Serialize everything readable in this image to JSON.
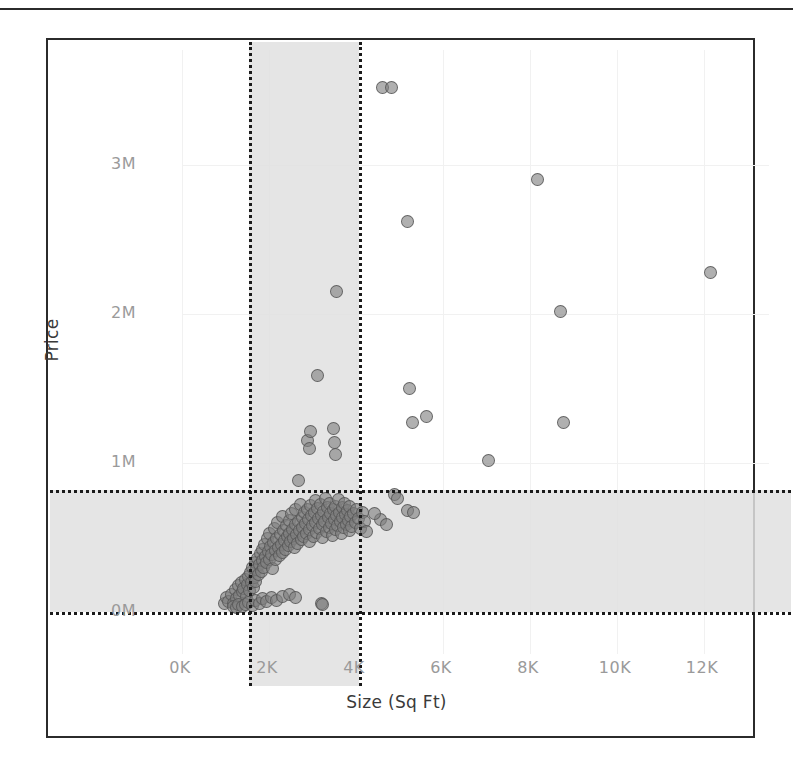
{
  "chart_data": {
    "type": "scatter",
    "title": "",
    "xlabel": "Size (Sq Ft)",
    "ylabel": "Price",
    "xlim": [
      0,
      13150
    ],
    "ylim": [
      -260000,
      4060000
    ],
    "xticks": [
      "0K",
      "2K",
      "4K",
      "6K",
      "8K",
      "10K",
      "12K"
    ],
    "xtick_values": [
      0,
      2000,
      4000,
      6000,
      8000,
      10000,
      12000
    ],
    "yticks": [
      "0M",
      "1M",
      "2M",
      "3M"
    ],
    "ytick_values": [
      0,
      1000000,
      2000000,
      3000000
    ],
    "grid": true,
    "legend": false,
    "marker_color": "#808080",
    "marker_edge_color": "#555555",
    "selection_band_color": "#e0e0e0",
    "selection_line_color": "#1a1a1a",
    "selections": [
      {
        "axis": "x",
        "label": "size-brush",
        "from": 1540,
        "to": 4070
      },
      {
        "axis": "y",
        "label": "price-brush",
        "from": 0,
        "to": 820000
      }
    ],
    "points": [
      [
        980,
        60000
      ],
      [
        1020,
        95000
      ],
      [
        1080,
        70000
      ],
      [
        1140,
        120000
      ],
      [
        1190,
        55000
      ],
      [
        1230,
        150000
      ],
      [
        1260,
        90000
      ],
      [
        1300,
        175000
      ],
      [
        1330,
        110000
      ],
      [
        1360,
        200000
      ],
      [
        1390,
        135000
      ],
      [
        1420,
        160000
      ],
      [
        1450,
        215000
      ],
      [
        1480,
        105000
      ],
      [
        1510,
        185000
      ],
      [
        1540,
        240000
      ],
      [
        1560,
        145000
      ],
      [
        1580,
        265000
      ],
      [
        1600,
        195000
      ],
      [
        1620,
        300000
      ],
      [
        1650,
        165000
      ],
      [
        1660,
        230000
      ],
      [
        1680,
        330000
      ],
      [
        1700,
        205000
      ],
      [
        1720,
        285000
      ],
      [
        1740,
        360000
      ],
      [
        1760,
        250000
      ],
      [
        1780,
        320000
      ],
      [
        1800,
        390000
      ],
      [
        1820,
        275000
      ],
      [
        1840,
        420000
      ],
      [
        1860,
        345000
      ],
      [
        1880,
        300000
      ],
      [
        1900,
        455000
      ],
      [
        1920,
        375000
      ],
      [
        1940,
        330000
      ],
      [
        1960,
        490000
      ],
      [
        1980,
        405000
      ],
      [
        2000,
        355000
      ],
      [
        2020,
        530000
      ],
      [
        2040,
        440000
      ],
      [
        2060,
        385000
      ],
      [
        2080,
        290000
      ],
      [
        2100,
        465000
      ],
      [
        2120,
        560000
      ],
      [
        2140,
        410000
      ],
      [
        2160,
        350000
      ],
      [
        2180,
        495000
      ],
      [
        2200,
        600000
      ],
      [
        2220,
        435000
      ],
      [
        2240,
        380000
      ],
      [
        2260,
        520000
      ],
      [
        2280,
        455000
      ],
      [
        2300,
        640000
      ],
      [
        2320,
        400000
      ],
      [
        2340,
        545000
      ],
      [
        2360,
        480000
      ],
      [
        2380,
        420000
      ],
      [
        2400,
        580000
      ],
      [
        2420,
        505000
      ],
      [
        2440,
        445000
      ],
      [
        2460,
        615000
      ],
      [
        2480,
        530000
      ],
      [
        2500,
        470000
      ],
      [
        2520,
        660000
      ],
      [
        2540,
        555000
      ],
      [
        2560,
        495000
      ],
      [
        2580,
        430000
      ],
      [
        2600,
        585000
      ],
      [
        2620,
        690000
      ],
      [
        2640,
        520000
      ],
      [
        2660,
        460000
      ],
      [
        2680,
        610000
      ],
      [
        2700,
        545000
      ],
      [
        2720,
        720000
      ],
      [
        2740,
        485000
      ],
      [
        2760,
        635000
      ],
      [
        2780,
        570000
      ],
      [
        2800,
        505000
      ],
      [
        2820,
        665000
      ],
      [
        2840,
        595000
      ],
      [
        2860,
        530000
      ],
      [
        2880,
        690000
      ],
      [
        2900,
        620000
      ],
      [
        2920,
        555000
      ],
      [
        2940,
        470000
      ],
      [
        2960,
        715000
      ],
      [
        2980,
        645000
      ],
      [
        3000,
        580000
      ],
      [
        3020,
        510000
      ],
      [
        3040,
        670000
      ],
      [
        3060,
        600000
      ],
      [
        3080,
        745000
      ],
      [
        3100,
        535000
      ],
      [
        3120,
        695000
      ],
      [
        3140,
        625000
      ],
      [
        3160,
        560000
      ],
      [
        3180,
        720000
      ],
      [
        3200,
        650000
      ],
      [
        3220,
        585000
      ],
      [
        3240,
        500000
      ],
      [
        3260,
        675000
      ],
      [
        3280,
        610000
      ],
      [
        3300,
        760000
      ],
      [
        3320,
        540000
      ],
      [
        3340,
        700000
      ],
      [
        3360,
        635000
      ],
      [
        3380,
        570000
      ],
      [
        3400,
        730000
      ],
      [
        3420,
        660000
      ],
      [
        3440,
        595000
      ],
      [
        3460,
        515000
      ],
      [
        3480,
        685000
      ],
      [
        3500,
        620000
      ],
      [
        3520,
        555000
      ],
      [
        3540,
        710000
      ],
      [
        3560,
        645000
      ],
      [
        3580,
        580000
      ],
      [
        3600,
        755000
      ],
      [
        3620,
        670000
      ],
      [
        3640,
        605000
      ],
      [
        3660,
        530000
      ],
      [
        3680,
        700000
      ],
      [
        3700,
        635000
      ],
      [
        3720,
        565000
      ],
      [
        3740,
        725000
      ],
      [
        3760,
        655000
      ],
      [
        3780,
        590000
      ],
      [
        3800,
        680000
      ],
      [
        3820,
        615000
      ],
      [
        3840,
        545000
      ],
      [
        3860,
        705000
      ],
      [
        3880,
        640000
      ],
      [
        3900,
        575000
      ],
      [
        3940,
        660000
      ],
      [
        3980,
        600000
      ],
      [
        4020,
        690000
      ],
      [
        4060,
        625000
      ],
      [
        4100,
        560000
      ],
      [
        4150,
        670000
      ],
      [
        4200,
        610000
      ],
      [
        4250,
        540000
      ],
      [
        2680,
        880000
      ],
      [
        2880,
        1150000
      ],
      [
        2920,
        1100000
      ],
      [
        2960,
        1210000
      ],
      [
        3120,
        1590000
      ],
      [
        3480,
        1230000
      ],
      [
        3500,
        1140000
      ],
      [
        3520,
        1060000
      ],
      [
        3560,
        2150000
      ],
      [
        4620,
        3520000
      ],
      [
        4820,
        3520000
      ],
      [
        5180,
        2620000
      ],
      [
        5240,
        1500000
      ],
      [
        5300,
        1270000
      ],
      [
        5620,
        1310000
      ],
      [
        4880,
        790000
      ],
      [
        4960,
        760000
      ],
      [
        5180,
        680000
      ],
      [
        5320,
        670000
      ],
      [
        4560,
        620000
      ],
      [
        4420,
        660000
      ],
      [
        4700,
        585000
      ],
      [
        7040,
        1020000
      ],
      [
        8180,
        2900000
      ],
      [
        8700,
        2020000
      ],
      [
        8760,
        1270000
      ],
      [
        12150,
        2280000
      ],
      [
        1180,
        40000
      ],
      [
        1250,
        32000
      ],
      [
        1310,
        48000
      ],
      [
        1380,
        38000
      ],
      [
        1460,
        52000
      ],
      [
        1540,
        62000
      ],
      [
        1620,
        45000
      ],
      [
        1700,
        75000
      ],
      [
        1780,
        58000
      ],
      [
        1860,
        88000
      ],
      [
        1940,
        68000
      ],
      [
        2050,
        95000
      ],
      [
        2180,
        78000
      ],
      [
        2320,
        105000
      ],
      [
        2460,
        120000
      ],
      [
        2600,
        98000
      ],
      [
        3200,
        55000
      ],
      [
        3240,
        50000
      ]
    ]
  }
}
